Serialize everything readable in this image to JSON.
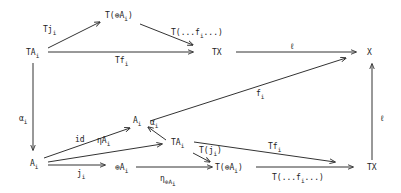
{
  "nodes": {
    "TA_top": {
      "main": "TA",
      "sub": "i"
    },
    "TsumA_top": {
      "main": "T(⊕A",
      "sub": "i",
      "tail": ")"
    },
    "TX_top": {
      "main": "TX"
    },
    "X": {
      "main": "X"
    },
    "A_left": {
      "main": "A",
      "sub": "i"
    },
    "A_mid": {
      "main": "A",
      "sub": "i"
    },
    "TA_mid": {
      "main": "TA",
      "sub": "i"
    },
    "sumA": {
      "main": "⊕A",
      "sub": "i"
    },
    "TsumA_bot": {
      "main": "T(⊕A",
      "sub": "i",
      "tail": ")"
    },
    "TX_bot": {
      "main": "TX"
    }
  },
  "edges": {
    "Tj": {
      "main": "Tj",
      "sub": "i"
    },
    "Tdots_top": {
      "main": "T(...f",
      "sub": "i",
      "tail": "...)"
    },
    "Tf_top": {
      "main": "Tf",
      "sub": "i"
    },
    "ell_top": {
      "main": "ℓ"
    },
    "alpha_left": {
      "main": "α",
      "sub": "i"
    },
    "f": {
      "main": "f",
      "sub": "i"
    },
    "id": {
      "main": "id"
    },
    "eta": {
      "main": "ηA",
      "sub": "i"
    },
    "alpha_mid": {
      "main": "α",
      "sub": "i"
    },
    "j": {
      "main": "j",
      "sub": "i"
    },
    "eta_sum": {
      "main": "η",
      "sub": "⊕A",
      "sub2": "i"
    },
    "Tj_paren": {
      "main": "T(j",
      "sub": "i",
      "tail": ")"
    },
    "Tf_bot": {
      "main": "Tf",
      "sub": "i"
    },
    "Tdots_bot": {
      "main": "T(...f",
      "sub": "i",
      "tail": "...)"
    },
    "ell_right": {
      "main": "ℓ"
    }
  }
}
